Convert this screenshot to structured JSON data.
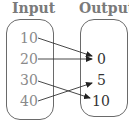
{
  "diagram": {
    "type": "mapping",
    "input_label": "Input",
    "output_label": "Output",
    "inputs": [
      "10",
      "20",
      "30",
      "40"
    ],
    "outputs": [
      "0",
      "5",
      "10"
    ],
    "mappings": [
      {
        "from": "10",
        "to": "0"
      },
      {
        "from": "20",
        "to": "0"
      },
      {
        "from": "30",
        "to": "10"
      },
      {
        "from": "40",
        "to": "5"
      }
    ]
  }
}
